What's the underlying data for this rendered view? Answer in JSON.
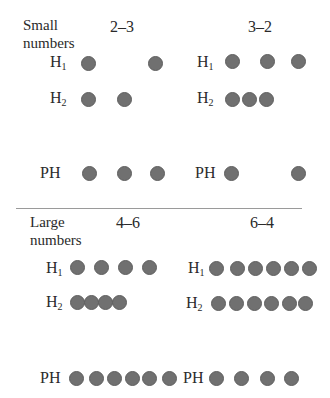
{
  "dot_color": "#707070",
  "sections": [
    {
      "label_line1": "Small",
      "label_line2": "numbers",
      "conditions": [
        {
          "title": "2–3",
          "rows": [
            {
              "label": "H",
              "sub": "1",
              "count": 2
            },
            {
              "label": "H",
              "sub": "2",
              "count": 2
            },
            {
              "label": "PH",
              "sub": "",
              "count": 3
            }
          ]
        },
        {
          "title": "3–2",
          "rows": [
            {
              "label": "H",
              "sub": "1",
              "count": 3
            },
            {
              "label": "H",
              "sub": "2",
              "count": 3
            },
            {
              "label": "PH",
              "sub": "",
              "count": 2
            }
          ]
        }
      ]
    },
    {
      "label_line1": "Large",
      "label_line2": "numbers",
      "conditions": [
        {
          "title": "4–6",
          "rows": [
            {
              "label": "H",
              "sub": "1",
              "count": 4
            },
            {
              "label": "H",
              "sub": "2",
              "count": 4
            },
            {
              "label": "PH",
              "sub": "",
              "count": 6
            }
          ]
        },
        {
          "title": "6–4",
          "rows": [
            {
              "label": "H",
              "sub": "1",
              "count": 6
            },
            {
              "label": "H",
              "sub": "2",
              "count": 6
            },
            {
              "label": "PH",
              "sub": "",
              "count": 4
            }
          ]
        }
      ]
    }
  ]
}
